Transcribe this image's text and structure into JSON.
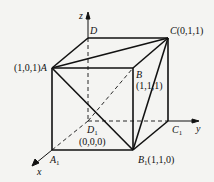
{
  "axes": {
    "x": "x",
    "y": "y",
    "z": "z"
  },
  "vertices": {
    "A": {
      "label": "A",
      "coord": "(1,0,1)"
    },
    "B": {
      "label": "B",
      "coord": "(1,1,1)"
    },
    "C": {
      "label": "C",
      "coord": "(0,1,1)"
    },
    "D": {
      "label": "D",
      "coord": ""
    },
    "A1": {
      "label": "A",
      "sub": "1",
      "coord": ""
    },
    "B1": {
      "label": "B",
      "sub": "1",
      "coord": "(1,1,0)"
    },
    "C1": {
      "label": "C",
      "sub": "1",
      "coord": ""
    },
    "D1": {
      "label": "D",
      "sub": "1",
      "coord": "(0,0,0)"
    }
  },
  "colors": {
    "line": "#111111",
    "background": "#f4f4f2"
  }
}
